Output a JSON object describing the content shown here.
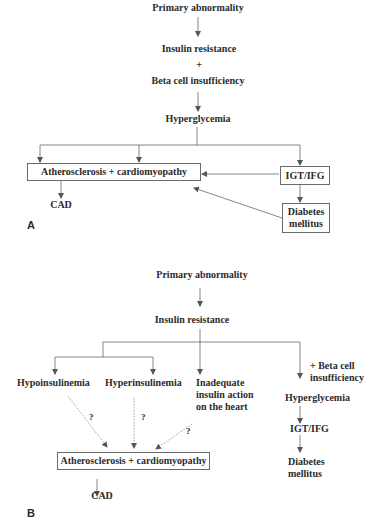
{
  "panel_a": {
    "label": "A",
    "nodes": {
      "primary": "Primary abnormality",
      "insulin_resistance": "Insulin resistance",
      "plus": "+",
      "beta_cell": "Beta cell insufficiency",
      "hyperglycemia": "Hyperglycemia",
      "athero": "Atherosclerosis + cardiomyopathy",
      "igt": "IGT/IFG",
      "diabetes_1": "Diabetes",
      "diabetes_2": "mellitus",
      "cad": "CAD"
    }
  },
  "panel_b": {
    "label": "B",
    "nodes": {
      "primary": "Primary abnormality",
      "insulin_resistance": "Insulin resistance",
      "hypo": "Hypoinsulinemia",
      "hyper": "Hyperinsulinemia",
      "inadequate_1": "Inadequate",
      "inadequate_2": "insulin action",
      "inadequate_3": "on the heart",
      "beta_1": "+ Beta cell",
      "beta_2": "insufficiency",
      "hyperglycemia": "Hyperglycemia",
      "igt": "IGT/IFG",
      "diabetes_1": "Diabetes",
      "diabetes_2": "mellitus",
      "athero": "Atherosclerosis + cardiomyopathy",
      "cad": "CAD",
      "q1": "?",
      "q2": "?",
      "q3": "?"
    }
  },
  "colors": {
    "line": "#555555",
    "text": "#2b2b2b"
  }
}
